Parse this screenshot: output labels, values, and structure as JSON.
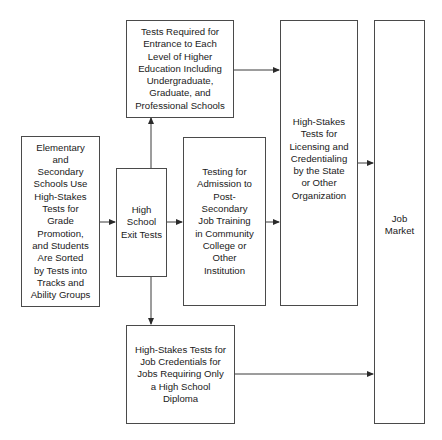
{
  "diagram": {
    "type": "flowchart",
    "boxes": {
      "elementary": {
        "label": "Elementary\nand\nSecondary\nSchools Use\nHigh-Stakes\nTests for\nGrade\nPromotion,\nand Students\nAre Sorted\nby Tests into\nTracks and\nAbility Groups"
      },
      "hs_exit": {
        "label": "High\nSchool\nExit Tests"
      },
      "higher_ed": {
        "label": "Tests Required for\nEntrance to Each\nLevel of Higher\nEducation Including\nUndergraduate,\nGraduate, and\nProfessional Schools"
      },
      "post_secondary": {
        "label": "Testing for\nAdmission to\nPost-\nSecondary\nJob Training\nin Community\nCollege or\nOther\nInstitution"
      },
      "licensing": {
        "label": "High-Stakes\nTests for\nLicensing and\nCredentialing\nby the State\nor Other\nOrganization"
      },
      "job_market": {
        "label": "Job\nMarket"
      },
      "hs_diploma_jobs": {
        "label": "High-Stakes Tests for\nJob Credentials for\nJobs Requiring Only\na High School\nDiploma"
      }
    },
    "edges": [
      {
        "from": "elementary",
        "to": "hs_exit"
      },
      {
        "from": "hs_exit",
        "to": "higher_ed"
      },
      {
        "from": "hs_exit",
        "to": "post_secondary"
      },
      {
        "from": "hs_exit",
        "to": "hs_diploma_jobs"
      },
      {
        "from": "higher_ed",
        "to": "licensing"
      },
      {
        "from": "post_secondary",
        "to": "licensing"
      },
      {
        "from": "licensing",
        "to": "job_market"
      },
      {
        "from": "hs_diploma_jobs",
        "to": "job_market"
      }
    ],
    "colors": {
      "line": "#3a3a3a",
      "border": "#4a4a4a",
      "text": "#1a1a1a",
      "background": "#ffffff"
    }
  }
}
